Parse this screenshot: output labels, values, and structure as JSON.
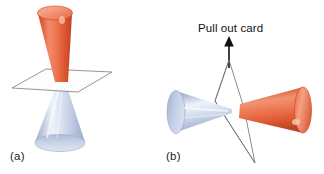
{
  "figure": {
    "background_color": "#ffffff",
    "width": 324,
    "height": 174,
    "caption_font_size": 11.5
  },
  "annotations": {
    "pull_out_card": "Pull out card",
    "arrow_direction": "up",
    "arrow_color": "#111111"
  },
  "panels": [
    {
      "label": "(a)",
      "description": "Two cones apex-to-apex separated by a thin flat card",
      "objects": {
        "top_cone": {
          "name": "red-cone",
          "orientation": "apex-down",
          "color_light": "#f08a6a",
          "color_mid": "#e8613c",
          "color_dark": "#c44526",
          "cap_color": "#f4a183",
          "cap_rim": "#d1512c"
        },
        "bottom_cone": {
          "name": "blue-cone",
          "orientation": "apex-up",
          "color_light": "#e7ecf6",
          "color_mid": "#c3cfe4",
          "color_dark": "#9aaac9",
          "cap_color": "#ccd6e8",
          "cap_rim": "#9fb0cd"
        },
        "card": {
          "name": "separating-card",
          "shape": "parallelogram",
          "fill": "#fdfdfd",
          "stroke": "#7a7a7a"
        }
      }
    },
    {
      "label": "(b)",
      "description": "Card pulled out; cones tip-to-tip horizontally",
      "objects": {
        "left_cone": {
          "name": "blue-cone",
          "orientation": "apex-right",
          "color_light": "#eef2f9",
          "color_mid": "#c3cfe4",
          "color_dark": "#8fa0c0",
          "cap_color": "#c7d2e6",
          "cap_rim": "#97a8c6"
        },
        "right_cone": {
          "name": "red-cone",
          "orientation": "apex-left",
          "color_light": "#f09372",
          "color_mid": "#e8613c",
          "color_dark": "#c9452a",
          "cap_color": "#f2a183",
          "cap_rim": "#cf4f2b"
        },
        "card": {
          "name": "pulled-card",
          "shape": "rhombus-edge-on",
          "stroke": "#6f6f6f"
        }
      }
    }
  ],
  "colors": {
    "red_accent": "#e8613c",
    "blue_accent": "#c3cfe4",
    "line_color": "#7a7a7a",
    "text_color": "#111111"
  }
}
